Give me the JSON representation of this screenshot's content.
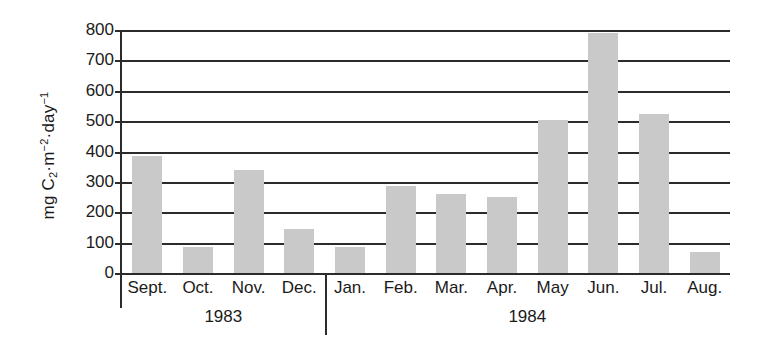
{
  "chart_data": {
    "type": "bar",
    "title": "",
    "xlabel": "",
    "ylabel": "mg C2·m-2·day-1",
    "ylabel_parts": {
      "prefix": "mg C",
      "sub1": "2",
      "mid": "·m",
      "sup1": "−2",
      "mid2": "·day",
      "sup2": "−1"
    },
    "categories": [
      "Sept.",
      "Oct.",
      "Nov.",
      "Dec.",
      "Jan.",
      "Feb.",
      "Mar.",
      "Apr.",
      "May",
      "Jun.",
      "Jul.",
      "Aug."
    ],
    "values": [
      385,
      85,
      340,
      145,
      85,
      285,
      260,
      250,
      505,
      790,
      525,
      70
    ],
    "ylim": [
      0,
      800
    ],
    "yticks": [
      0,
      100,
      200,
      300,
      400,
      500,
      600,
      700,
      800
    ],
    "grid": true,
    "legend": "none",
    "bar_color": "#c9c9c9",
    "axis_color": "#2b2b2b",
    "groups": [
      {
        "label": "1983",
        "start": 0,
        "count": 4
      },
      {
        "label": "1984",
        "start": 4,
        "count": 8
      }
    ]
  }
}
